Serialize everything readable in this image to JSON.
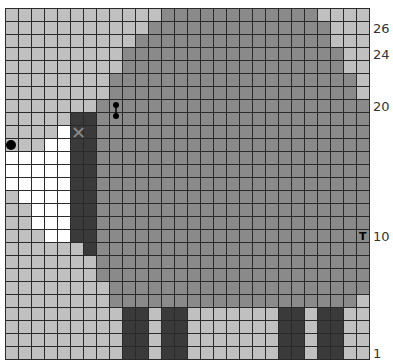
{
  "chart": {
    "columns": 28,
    "rows": 27,
    "legend": {
      "L": {
        "name": "light-gray",
        "color": "#c0c0c0"
      },
      "M": {
        "name": "medium-gray",
        "color": "#8a8a8a"
      },
      "D": {
        "name": "dark-gray",
        "color": "#3a3a3a"
      },
      "W": {
        "name": "white",
        "color": "#ffffff"
      }
    },
    "cells_top_to_bottom": [
      "LLLLLLLLLLLLMMMMMMMMMMMMLLLL",
      "LLLLLLLLLLLMMMMMMMMMMMMMMLLL",
      "LLLLLLLLLLMMMMMMMMMMMMMMMLLL",
      "LLLLLLLLLMMMMMMMMMMMMMMMMMLL",
      "LLLLLLLLLMMMMMMMMMMMMMMMMMLL",
      "LLLLLLLLMMMMMMMMMMMMMMMMMMML",
      "LLLLLLLLMMMMMMMMMMMMMMMMMMML",
      "LLLLLLLMMMMMMMMMMMMMMMMMMMMM",
      "LLLLLDDMMMMMMMMMMMMMMMMMMMMM",
      "LLLLWDDMMMMMMMMMMMMMMMMMMMMM",
      "LLLWWDDMMMMMMMMMMMMMMMMMMMMM",
      "WWWWWDDMMMMMMMMMMMMMMMMMMMMM",
      "WWWWWDDMMMMMMMMMMMMMMMMMMMMM",
      "WWWWWDDMMMMMMMMMMMMMMMMMMMMM",
      "LWWWWDDMMMMMMMMMMMMMMMMMMMMM",
      "LLWWWDDMMMMMMMMMMMMMMMMMMMMM",
      "LLWWWDDMMMMMMMMMMMMMMMMMMMMM",
      "LLLWWDDMMMMMMMMMMMMMMMMMMMMM",
      "LLLLLLDMMMMMMMMMMMMMMMMMMMMM",
      "LLLLLLLMMMMMMMMMMMMMMMMMMMMM",
      "LLLLLLLMMMMMMMMMMMMMMMMMMMMM",
      "LLLLLLLLMMMMMMMMMMMMMMMMMMMM",
      "LLLLLLLLMMMMMMMMMMMMMMMMMMML",
      "LLLLLLLLLDDLDDLLLLLLLDDLDDLL",
      "LLLLLLLLLDDLDDLLLLLLLDDLDDLL",
      "LLLLLLLLLDDLDDLLLLLLLDDLDDLL",
      "LLLLLLLLLDDLDDLLLLLLLDDLDDLL"
    ],
    "row_labels": [
      {
        "row": 26,
        "text": "26"
      },
      {
        "row": 24,
        "text": "24"
      },
      {
        "row": 20,
        "text": "20"
      },
      {
        "row": 10,
        "text": "10"
      },
      {
        "row": 1,
        "text": "1"
      }
    ],
    "symbols": [
      {
        "name": "black-dot",
        "row": 17,
        "col": 1,
        "glyph": ""
      },
      {
        "name": "x-mark",
        "row": 18,
        "col": 6,
        "glyph": "✕"
      },
      {
        "name": "dumbbell",
        "row": 20,
        "col": 9,
        "span_rows": 2,
        "glyph": ""
      },
      {
        "name": "t-mark",
        "row": 10,
        "col": 28,
        "glyph": "T"
      }
    ]
  }
}
